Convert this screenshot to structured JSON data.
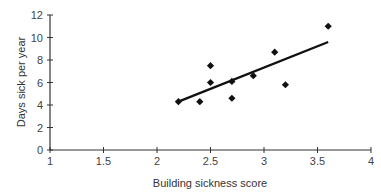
{
  "chart_data": {
    "type": "scatter",
    "title": "",
    "xlabel": "Building sickness score",
    "ylabel": "Days sick per year",
    "xlim": [
      1,
      4
    ],
    "ylim": [
      0,
      12
    ],
    "x_ticks": [
      "1",
      "1.5",
      "2",
      "2.5",
      "3",
      "3.5",
      "4"
    ],
    "y_ticks": [
      "0",
      "2",
      "4",
      "6",
      "8",
      "10",
      "12"
    ],
    "grid": false,
    "legend": null,
    "series": [
      {
        "name": "Observations",
        "marker": "diamond",
        "points": [
          {
            "x": 2.2,
            "y": 4.3
          },
          {
            "x": 2.4,
            "y": 4.3
          },
          {
            "x": 2.5,
            "y": 7.5
          },
          {
            "x": 2.5,
            "y": 6.0
          },
          {
            "x": 2.7,
            "y": 6.1
          },
          {
            "x": 2.7,
            "y": 4.6
          },
          {
            "x": 2.9,
            "y": 6.6
          },
          {
            "x": 3.1,
            "y": 8.7
          },
          {
            "x": 3.2,
            "y": 5.8
          },
          {
            "x": 3.6,
            "y": 11.0
          }
        ]
      }
    ],
    "trendline": {
      "x1": 2.2,
      "y1": 4.3,
      "x2": 3.6,
      "y2": 9.6
    }
  }
}
